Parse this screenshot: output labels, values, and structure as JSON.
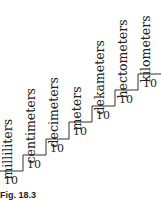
{
  "figure": {
    "caption": "Fig. 18.3",
    "steps": [
      {
        "label": "milliliters",
        "factor": "10"
      },
      {
        "label": "centimeters",
        "factor": "10"
      },
      {
        "label": "decimeters",
        "factor": "10"
      },
      {
        "label": "meters",
        "factor": "10"
      },
      {
        "label": "dekameters",
        "factor": "10"
      },
      {
        "label": "hectometers",
        "factor": "10"
      },
      {
        "label": "kilometers",
        "factor": "10"
      }
    ]
  }
}
